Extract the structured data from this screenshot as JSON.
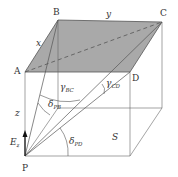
{
  "vertices": {
    "A": "A",
    "B": "B",
    "C": "C",
    "D": "D",
    "P": "P"
  },
  "edges": {
    "x": "x",
    "y": "y",
    "z": "z"
  },
  "angles": {
    "gamma_bc": {
      "sym": "γ",
      "sub": "BC"
    },
    "gamma_cd": {
      "sym": "γ",
      "sub": "CD"
    },
    "delta_pb": {
      "sym": "δ",
      "sub": "PB"
    },
    "delta_pd": {
      "sym": "δ",
      "sub": "PD"
    }
  },
  "field": {
    "sym": "E",
    "sub": "z"
  },
  "surface": "S",
  "colors": {
    "plane_fill": "#a9a9a9",
    "line": "#555555"
  }
}
